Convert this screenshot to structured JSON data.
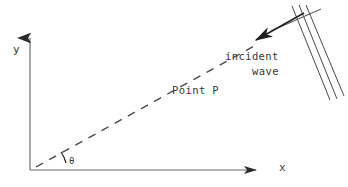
{
  "figure": {
    "background_color": "#ffffff",
    "ink_color": "#3a3a3a",
    "width": 348,
    "height": 187
  },
  "axes": {
    "origin": {
      "x": 30,
      "y": 170
    },
    "y_axis": {
      "label": "y",
      "from": {
        "x": 30,
        "y": 170
      },
      "to": {
        "x": 30,
        "y": 34
      },
      "arrow": "up"
    },
    "x_axis": {
      "label": "x",
      "from": {
        "x": 30,
        "y": 170
      },
      "to": {
        "x": 262,
        "y": 170
      },
      "arrow": "right"
    }
  },
  "angle": {
    "label": "θ",
    "arc_radius": 30,
    "degrees": 30
  },
  "ray": {
    "label": "Point P",
    "style": "dashed",
    "from": {
      "x": 34,
      "y": 168
    },
    "to": {
      "x": 258,
      "y": 44
    }
  },
  "wave": {
    "label_line_1": "incident",
    "label_line_2": "wave",
    "wavefronts": [
      {
        "x1": 292,
        "y1": 6,
        "x2": 330,
        "y2": 100
      },
      {
        "x1": 299,
        "y1": 5,
        "x2": 337,
        "y2": 99
      },
      {
        "x1": 306,
        "y1": 5,
        "x2": 344,
        "y2": 96
      }
    ],
    "cross_line": {
      "x1": 271,
      "y1": 30,
      "x2": 321,
      "y2": 9
    },
    "propagation_arrow": {
      "x1": 305,
      "y1": 12,
      "x2": 254,
      "y2": 40,
      "direction": "down-left"
    }
  }
}
